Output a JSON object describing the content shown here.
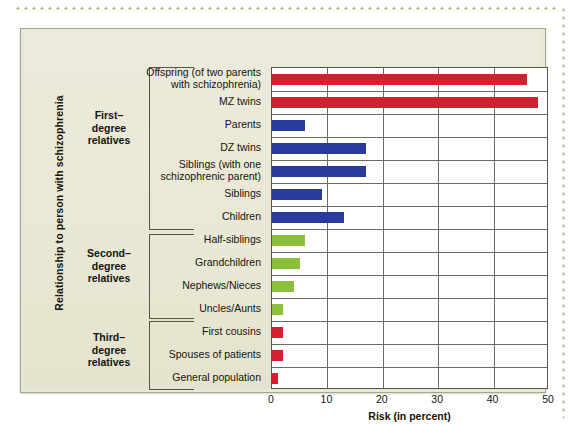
{
  "figure": {
    "y_axis_title": "Relationship to person with schizophrenia",
    "x_axis_title": "Risk (in percent)"
  },
  "groups": [
    {
      "label": "First–\ndegree\nrelatives"
    },
    {
      "label": "Second–\ndegree\nrelatives"
    },
    {
      "label": "Third–\ndegree\nrelatives"
    }
  ],
  "group_labels": {
    "first": "First–\ndegree\nrelatives",
    "second": "Second–\ndegree\nrelatives",
    "third": "Third–\ndegree\nrelatives"
  },
  "chart_data": {
    "type": "bar",
    "orientation": "horizontal",
    "title": "",
    "xlabel": "Risk (in percent)",
    "ylabel": "Relationship to person with schizophrenia",
    "xlim": [
      0,
      50
    ],
    "xticks": [
      0,
      10,
      20,
      30,
      40,
      50
    ],
    "xtick_labels": [
      "0",
      "10",
      "20",
      "30",
      "40",
      "50"
    ],
    "grid": true,
    "legend": "none",
    "colors": {
      "red": "#d32030",
      "blue": "#2a3b9e",
      "green": "#8cc03c",
      "panel_background": "#e8e8d5",
      "plot_background": "#ffffff",
      "axis": "#55554a"
    },
    "categories": [
      "Offspring (of two parents with schizophrenia)",
      "MZ twins",
      "Parents",
      "DZ twins",
      "Siblings (with one schizophrenic parent)",
      "Siblings",
      "Children",
      "Half-siblings",
      "Grandchildren",
      "Nephews/Nieces",
      "Uncles/Aunts",
      "First cousins",
      "Spouses  of patients",
      "General population"
    ],
    "values": [
      46,
      48,
      6,
      17,
      17,
      9,
      13,
      6,
      5,
      4,
      2,
      2,
      2,
      1
    ],
    "bar_colors": [
      "red",
      "red",
      "blue",
      "blue",
      "blue",
      "blue",
      "blue",
      "green",
      "green",
      "green",
      "green",
      "red",
      "red",
      "red"
    ],
    "group_of_category": [
      "first",
      "first",
      "first",
      "first",
      "first",
      "first",
      "first",
      "second",
      "second",
      "second",
      "second",
      "third",
      "third",
      "third"
    ]
  },
  "labels": {
    "l0a": "Offspring (of two parents",
    "l0b": "with schizophrenia)",
    "l1": "MZ twins",
    "l2": "Parents",
    "l3": "DZ twins",
    "l4a": "Siblings (with one",
    "l4b": "schizophrenic parent)",
    "l5": "Siblings",
    "l6": "Children",
    "l7": "Half-siblings",
    "l8": "Grandchildren",
    "l9": "Nephews/Nieces",
    "l10": "Uncles/Aunts",
    "l11": "First cousins",
    "l12": "Spouses  of patients",
    "l13": "General population"
  }
}
